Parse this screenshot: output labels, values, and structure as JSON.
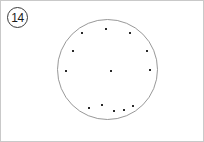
{
  "panel": {
    "background_color": "#ffffff",
    "border_color": "#c9c9c9",
    "width": 204,
    "height": 142
  },
  "badge": {
    "label": "14",
    "shape": "circle-outline",
    "text_color": "#1a1a1a",
    "border_color": "#3a3a3a"
  },
  "figure": {
    "name": "dot-pattern-circle",
    "circle": {
      "cx": 106.5,
      "cy": 68.5,
      "r": 50,
      "stroke_color": "#8c8c8c",
      "stroke_width": 0.9,
      "fill": "none"
    },
    "dot_style": {
      "color": "#2b2b2b",
      "size": 2.4,
      "shape": "square"
    },
    "dot_count": 13,
    "dots": [
      {
        "id": "dot-top-center",
        "x": 105,
        "y": 28
      },
      {
        "id": "dot-upper-left",
        "x": 81,
        "y": 32
      },
      {
        "id": "dot-upper-right",
        "x": 129,
        "y": 32
      },
      {
        "id": "dot-left-upper",
        "x": 72,
        "y": 50
      },
      {
        "id": "dot-right-upper",
        "x": 146,
        "y": 50
      },
      {
        "id": "dot-left-middle",
        "x": 65,
        "y": 70
      },
      {
        "id": "dot-center",
        "x": 110,
        "y": 70
      },
      {
        "id": "dot-right-middle",
        "x": 149,
        "y": 69
      },
      {
        "id": "dot-bottom-1",
        "x": 88,
        "y": 107
      },
      {
        "id": "dot-bottom-2",
        "x": 101,
        "y": 104
      },
      {
        "id": "dot-bottom-3",
        "x": 113,
        "y": 110
      },
      {
        "id": "dot-bottom-4",
        "x": 123,
        "y": 109
      },
      {
        "id": "dot-bottom-5",
        "x": 132,
        "y": 105
      }
    ]
  }
}
